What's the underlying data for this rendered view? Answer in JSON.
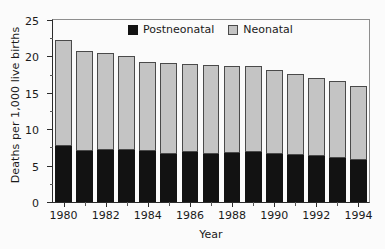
{
  "chart_data": {
    "type": "bar",
    "stacked": true,
    "title": "",
    "xlabel": "Year",
    "ylabel": "Deaths per 1,000 live births",
    "ylim": [
      0,
      25
    ],
    "ytick_values": [
      0,
      5,
      10,
      15,
      20,
      25
    ],
    "ytick_labels": [
      "0",
      "5",
      "10",
      "15",
      "20",
      "25"
    ],
    "yminor_values": [
      2.5,
      7.5,
      12.5,
      17.5,
      22.5
    ],
    "grid": false,
    "legend_position": "top-center",
    "categories": [
      "1980",
      "1981",
      "1982",
      "1983",
      "1984",
      "1985",
      "1986",
      "1987",
      "1988",
      "1989",
      "1990",
      "1991",
      "1992",
      "1993",
      "1994"
    ],
    "xtick_labels_shown": [
      "1980",
      "1982",
      "1984",
      "1986",
      "1988",
      "1990",
      "1992",
      "1994"
    ],
    "series": [
      {
        "name": "Postneonatal",
        "color": "#121212",
        "values": [
          7.7,
          7.0,
          7.1,
          7.2,
          7.0,
          6.6,
          6.8,
          6.6,
          6.7,
          6.9,
          6.6,
          6.4,
          6.3,
          6.1,
          5.8
        ]
      },
      {
        "name": "Neonatal",
        "color": "#c4c4c4",
        "values": [
          14.6,
          13.8,
          13.4,
          12.8,
          12.2,
          12.5,
          12.1,
          12.2,
          12.0,
          11.8,
          11.5,
          11.2,
          10.7,
          10.5,
          10.1
        ]
      }
    ],
    "totals": [
      22.3,
      20.8,
      20.5,
      20.0,
      19.2,
      19.1,
      18.9,
      18.8,
      18.7,
      18.7,
      18.1,
      17.6,
      17.0,
      16.6,
      15.9
    ]
  },
  "legend": {
    "items": [
      {
        "label": "Postneonatal",
        "color": "#121212"
      },
      {
        "label": "Neonatal",
        "color": "#c4c4c4"
      }
    ]
  }
}
